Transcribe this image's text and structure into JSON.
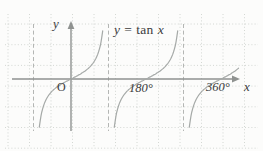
{
  "figure": {
    "equation": {
      "lhs": "y",
      "eq": "=",
      "func": "tan",
      "arg": "x"
    },
    "labels": {
      "origin": "O",
      "x_axis": "x",
      "y_axis": "y",
      "tick_180": "180°",
      "tick_360": "360°"
    }
  },
  "chart_data": {
    "type": "line",
    "xlabel": "x",
    "ylabel": "y",
    "x_unit": "degrees",
    "function": "y = tan(x)",
    "x_ticks": [
      {
        "deg": 0,
        "label": "O"
      },
      {
        "deg": 180,
        "label": "180°"
      },
      {
        "deg": 360,
        "label": "360°"
      }
    ],
    "asymptotes_deg": [
      -90,
      90,
      270
    ],
    "branches": [
      {
        "center_deg": 0,
        "y_top_clip_px": 26
      },
      {
        "center_deg": 180,
        "y_top_clip_px": 26
      },
      {
        "center_deg": 360,
        "y_top_clip_px": 68
      }
    ],
    "plot": {
      "width": 263,
      "height": 151,
      "origin_px": {
        "x": 71,
        "y": 79
      },
      "px_per_90deg": 37.5,
      "px_per_unit": 12,
      "y_bottom_clip_px": 133,
      "theta_max_deg": 78,
      "sample_step_deg": 2,
      "asymptote_y_range": [
        24,
        131
      ],
      "x_axis_range": [
        12,
        233
      ],
      "x_axis_arrow_tip": 240,
      "y_axis_range": [
        28,
        131
      ],
      "y_axis_arrow_tip": 21
    },
    "grid": {
      "x_start": 8,
      "x_step": 21.5,
      "x_count": 12,
      "y_start": 24,
      "y_step": 20.7,
      "y_count": 7,
      "x_min": 5,
      "x_max": 258,
      "y_min": 14,
      "y_max": 148
    },
    "colors": {
      "background": "#fcfcfb",
      "grid": "#c9cec9",
      "asymptote": "#b4b6b4",
      "axis": "#8f9290",
      "curve": "#a5a9a7",
      "text": "#3b3b3b"
    }
  }
}
